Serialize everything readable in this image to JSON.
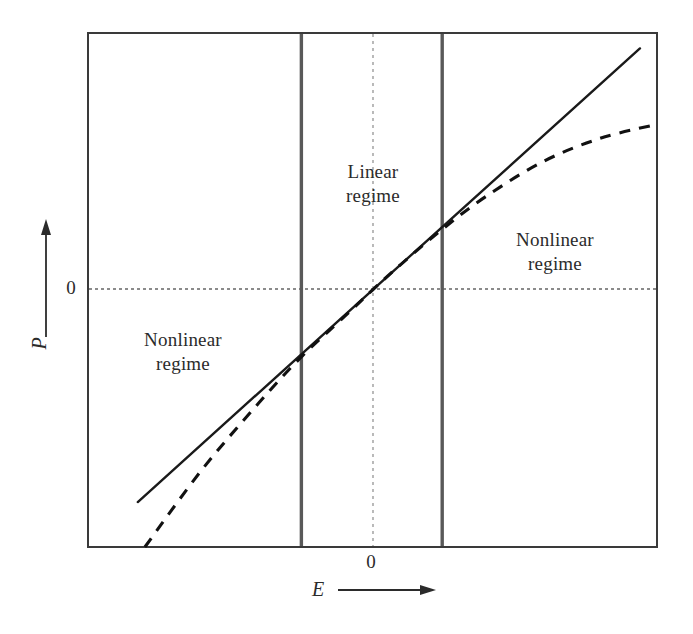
{
  "figure": {
    "background": "#ffffff",
    "ink_color": "#1a1a1a",
    "frame_color": "#3a3a3a"
  },
  "axes": {
    "x": {
      "name": "E",
      "zero_label": "0",
      "arrow": "right-arrow-icon",
      "ticks": [
        "0"
      ]
    },
    "y": {
      "name": "P",
      "zero_label": "0",
      "arrow": "up-arrow-icon",
      "ticks": [
        "0"
      ]
    }
  },
  "regions": {
    "linear": {
      "line1": "Linear",
      "line2": "regime"
    },
    "nonlinear_left": {
      "line1": "Nonlinear",
      "line2": "regime"
    },
    "nonlinear_right": {
      "line1": "Nonlinear",
      "line2": "regime"
    }
  },
  "chart_data": {
    "type": "line",
    "title": "",
    "xlabel": "E",
    "ylabel": "P",
    "grid": false,
    "legend": null,
    "xlim": [
      -1.0,
      1.0
    ],
    "ylim": [
      -1.0,
      1.0
    ],
    "xticks": [
      0
    ],
    "xticklabels": [
      "0"
    ],
    "yticks": [
      0
    ],
    "yticklabels": [
      "0"
    ],
    "annotations": [
      {
        "text": "Linear regime",
        "x": 0.0,
        "y": 0.56
      },
      {
        "text": "Nonlinear regime",
        "x": -0.67,
        "y": -0.1
      },
      {
        "text": "Nonlinear regime",
        "x": 0.64,
        "y": 0.3
      }
    ],
    "reference_lines": [
      {
        "orientation": "vertical",
        "x": -0.25,
        "style": "solid-gray",
        "label": "linear-regime-left-boundary"
      },
      {
        "orientation": "vertical",
        "x": 0.245,
        "style": "solid-gray",
        "label": "linear-regime-right-boundary"
      },
      {
        "orientation": "vertical",
        "x": 0.0,
        "style": "dotted",
        "label": "x-zero-axis"
      },
      {
        "orientation": "horizontal",
        "y": 0.0,
        "style": "dotted",
        "label": "y-zero-axis"
      }
    ],
    "series": [
      {
        "name": "linear response (solid)",
        "style": "solid",
        "x": [
          -0.825,
          -0.25,
          0.0,
          0.245,
          0.94
        ],
        "y": [
          -0.825,
          -0.25,
          0.0,
          0.245,
          0.94
        ]
      },
      {
        "name": "actual polarization (dashed)",
        "style": "dashed",
        "x": [
          -0.8,
          -0.6,
          -0.4,
          -0.25,
          -0.1,
          0.0,
          0.1,
          0.245,
          0.4,
          0.6,
          0.8,
          1.0
        ],
        "y": [
          -1.0,
          -0.7,
          -0.44,
          -0.26,
          -0.105,
          0.0,
          0.1,
          0.236,
          0.365,
          0.5,
          0.59,
          0.645
        ]
      }
    ]
  }
}
